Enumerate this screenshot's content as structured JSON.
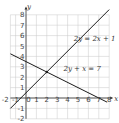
{
  "chart_data": {
    "type": "line",
    "title": "",
    "xlabel": "x",
    "ylabel": "y",
    "xlim": [
      -1.5,
      8
    ],
    "ylim": [
      -2,
      8.5
    ],
    "grid": true,
    "x_ticks": [
      "-2",
      "-1",
      "0",
      "1",
      "2",
      "3",
      "4",
      "5",
      "6",
      "7",
      "8"
    ],
    "x_tick_values": [
      -2,
      -1,
      0,
      1,
      2,
      3,
      4,
      5,
      6,
      7,
      8
    ],
    "y_ticks": [
      "-2",
      "-1",
      "1",
      "2",
      "3",
      "4",
      "5",
      "6",
      "7",
      "8"
    ],
    "y_tick_values": [
      -2,
      -1,
      1,
      2,
      3,
      4,
      5,
      6,
      7,
      8
    ],
    "series": [
      {
        "name": "2y = 2x + 1",
        "label": "2y = 2x + 1",
        "slope": 1,
        "intercept": 0.5,
        "x_range": [
          -1.5,
          8
        ],
        "label_anchor": [
          6.6,
          5.5
        ]
      },
      {
        "name": "2y + x = 7",
        "label": "2y + x = 7",
        "slope": -0.5,
        "intercept": 3.5,
        "x_range": [
          -1.5,
          7.8
        ],
        "label_anchor": [
          5.4,
          2.6
        ]
      }
    ],
    "intersection": [
      2,
      2.5
    ]
  }
}
